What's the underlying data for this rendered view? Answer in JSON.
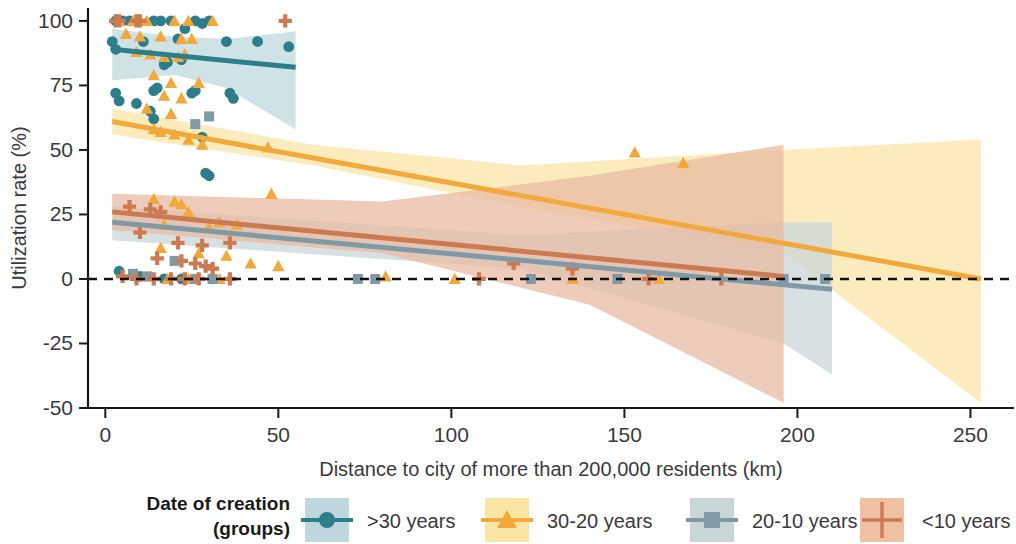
{
  "chart_data": {
    "type": "scatter",
    "title": "",
    "xlabel": "Distance to city of more than 200,000 residents (km)",
    "ylabel": "Utilization rate (%)",
    "xlim": [
      -5,
      262
    ],
    "ylim": [
      -50,
      105
    ],
    "xticks": [
      0,
      50,
      100,
      150,
      200,
      250
    ],
    "xticklabels": [
      "0",
      "50",
      "100",
      "150",
      "200",
      "250"
    ],
    "yticks": [
      -50,
      -25,
      0,
      25,
      50,
      75,
      100
    ],
    "yticklabels": [
      "-50",
      "-25",
      "0",
      "25",
      "50",
      "75",
      "100"
    ],
    "grid": false,
    "legend_position": "below",
    "reference_line": {
      "y": 0,
      "style": "dashed",
      "color": "#111111"
    },
    "series": [
      {
        "name": ">30 years",
        "marker": "circle",
        "color": "#2e7d8a",
        "band_color": "#bcd8dd",
        "fit": {
          "x0": 2,
          "y0": 89,
          "x1": 55,
          "y1": 82
        },
        "band": [
          {
            "x": 2,
            "lo": 77,
            "hi": 97
          },
          {
            "x": 20,
            "lo": 79,
            "hi": 94
          },
          {
            "x": 35,
            "lo": 74,
            "hi": 93
          },
          {
            "x": 55,
            "lo": 58,
            "hi": 96
          }
        ],
        "points": [
          {
            "x": 3,
            "y": 100
          },
          {
            "x": 5,
            "y": 100
          },
          {
            "x": 7,
            "y": 100
          },
          {
            "x": 14,
            "y": 100
          },
          {
            "x": 16,
            "y": 100
          },
          {
            "x": 19,
            "y": 100
          },
          {
            "x": 26,
            "y": 100
          },
          {
            "x": 28,
            "y": 99
          },
          {
            "x": 30,
            "y": 100
          },
          {
            "x": 2,
            "y": 92
          },
          {
            "x": 3,
            "y": 89
          },
          {
            "x": 11,
            "y": 92
          },
          {
            "x": 21,
            "y": 93
          },
          {
            "x": 23,
            "y": 97
          },
          {
            "x": 35,
            "y": 92
          },
          {
            "x": 44,
            "y": 92
          },
          {
            "x": 53,
            "y": 90
          },
          {
            "x": 17,
            "y": 83
          },
          {
            "x": 18,
            "y": 84
          },
          {
            "x": 22,
            "y": 85
          },
          {
            "x": 14,
            "y": 73
          },
          {
            "x": 15,
            "y": 74
          },
          {
            "x": 25,
            "y": 72
          },
          {
            "x": 26,
            "y": 73
          },
          {
            "x": 36,
            "y": 72
          },
          {
            "x": 37,
            "y": 70
          },
          {
            "x": 3,
            "y": 72
          },
          {
            "x": 4,
            "y": 69
          },
          {
            "x": 9,
            "y": 68
          },
          {
            "x": 13,
            "y": 65
          },
          {
            "x": 14,
            "y": 62
          },
          {
            "x": 28,
            "y": 55
          },
          {
            "x": 29,
            "y": 41
          },
          {
            "x": 30,
            "y": 40
          },
          {
            "x": 4,
            "y": 3
          },
          {
            "x": 10,
            "y": 1
          },
          {
            "x": 17,
            "y": 0
          },
          {
            "x": 22,
            "y": 0
          },
          {
            "x": 31,
            "y": 0
          }
        ]
      },
      {
        "name": "30-20 years",
        "marker": "triangle",
        "color": "#f2a93b",
        "band_color": "#fbe5a4",
        "fit": {
          "x0": 2,
          "y0": 61,
          "x1": 253,
          "y1": 0
        },
        "band": [
          {
            "x": 2,
            "lo": 56,
            "hi": 66
          },
          {
            "x": 60,
            "lo": 44,
            "hi": 52
          },
          {
            "x": 120,
            "lo": 28,
            "hi": 44
          },
          {
            "x": 196,
            "lo": 10,
            "hi": 50
          },
          {
            "x": 253,
            "lo": -48,
            "hi": 54
          }
        ],
        "points": [
          {
            "x": 4,
            "y": 100
          },
          {
            "x": 8,
            "y": 100
          },
          {
            "x": 12,
            "y": 100
          },
          {
            "x": 20,
            "y": 100
          },
          {
            "x": 24,
            "y": 100
          },
          {
            "x": 31,
            "y": 100
          },
          {
            "x": 6,
            "y": 95
          },
          {
            "x": 10,
            "y": 94
          },
          {
            "x": 16,
            "y": 94
          },
          {
            "x": 22,
            "y": 93
          },
          {
            "x": 25,
            "y": 93
          },
          {
            "x": 9,
            "y": 88
          },
          {
            "x": 13,
            "y": 87
          },
          {
            "x": 17,
            "y": 86
          },
          {
            "x": 21,
            "y": 86
          },
          {
            "x": 23,
            "y": 87
          },
          {
            "x": 14,
            "y": 79
          },
          {
            "x": 19,
            "y": 76
          },
          {
            "x": 27,
            "y": 76
          },
          {
            "x": 17,
            "y": 71
          },
          {
            "x": 22,
            "y": 70
          },
          {
            "x": 12,
            "y": 66
          },
          {
            "x": 19,
            "y": 64
          },
          {
            "x": 14,
            "y": 58
          },
          {
            "x": 16,
            "y": 57
          },
          {
            "x": 20,
            "y": 56
          },
          {
            "x": 24,
            "y": 54
          },
          {
            "x": 28,
            "y": 52
          },
          {
            "x": 47,
            "y": 51
          },
          {
            "x": 48,
            "y": 33
          },
          {
            "x": 153,
            "y": 49
          },
          {
            "x": 167,
            "y": 45
          },
          {
            "x": 14,
            "y": 31
          },
          {
            "x": 20,
            "y": 30
          },
          {
            "x": 22,
            "y": 29
          },
          {
            "x": 24,
            "y": 26
          },
          {
            "x": 17,
            "y": 21
          },
          {
            "x": 30,
            "y": 20
          },
          {
            "x": 33,
            "y": 22
          },
          {
            "x": 38,
            "y": 21
          },
          {
            "x": 16,
            "y": 12
          },
          {
            "x": 27,
            "y": 10
          },
          {
            "x": 35,
            "y": 9
          },
          {
            "x": 42,
            "y": 6
          },
          {
            "x": 50,
            "y": 5
          },
          {
            "x": 13,
            "y": 1
          },
          {
            "x": 18,
            "y": 0
          },
          {
            "x": 24,
            "y": 0
          },
          {
            "x": 33,
            "y": 0
          },
          {
            "x": 81,
            "y": 1
          },
          {
            "x": 101,
            "y": 0
          },
          {
            "x": 135,
            "y": 0
          },
          {
            "x": 160,
            "y": 0
          }
        ]
      },
      {
        "name": "20-10 years",
        "marker": "square",
        "color": "#7f9aa6",
        "band_color": "#c8d6d8",
        "fit": {
          "x0": 2,
          "y0": 22,
          "x1": 210,
          "y1": -4
        },
        "band": [
          {
            "x": 2,
            "lo": 15,
            "hi": 28
          },
          {
            "x": 120,
            "lo": 4,
            "hi": 17
          },
          {
            "x": 196,
            "lo": -25,
            "hi": 22
          },
          {
            "x": 210,
            "lo": -37,
            "hi": 22
          }
        ],
        "points": [
          {
            "x": 30,
            "y": 63
          },
          {
            "x": 26,
            "y": 60
          },
          {
            "x": 20,
            "y": 7
          },
          {
            "x": 8,
            "y": 2
          },
          {
            "x": 12,
            "y": 1
          },
          {
            "x": 26,
            "y": 0
          },
          {
            "x": 31,
            "y": 0
          },
          {
            "x": 73,
            "y": 0
          },
          {
            "x": 78,
            "y": 0
          },
          {
            "x": 123,
            "y": 0
          },
          {
            "x": 148,
            "y": 0
          },
          {
            "x": 196,
            "y": 0
          },
          {
            "x": 208,
            "y": 0
          }
        ]
      },
      {
        "name": "<10 years",
        "marker": "plus",
        "color": "#cc7a52",
        "band_color": "#e9b9a0",
        "fit": {
          "x0": 2,
          "y0": 26,
          "x1": 196,
          "y1": 1
        },
        "band": [
          {
            "x": 2,
            "lo": 19,
            "hi": 33
          },
          {
            "x": 80,
            "lo": 10,
            "hi": 30
          },
          {
            "x": 140,
            "lo": -10,
            "hi": 40
          },
          {
            "x": 196,
            "lo": -48,
            "hi": 52
          }
        ],
        "points": [
          {
            "x": 3,
            "y": 100
          },
          {
            "x": 4,
            "y": 100
          },
          {
            "x": 9,
            "y": 100
          },
          {
            "x": 10,
            "y": 100
          },
          {
            "x": 52,
            "y": 100
          },
          {
            "x": 7,
            "y": 28
          },
          {
            "x": 13,
            "y": 27
          },
          {
            "x": 16,
            "y": 26
          },
          {
            "x": 10,
            "y": 18
          },
          {
            "x": 21,
            "y": 14
          },
          {
            "x": 28,
            "y": 13
          },
          {
            "x": 36,
            "y": 14
          },
          {
            "x": 15,
            "y": 8
          },
          {
            "x": 22,
            "y": 7
          },
          {
            "x": 26,
            "y": 6
          },
          {
            "x": 29,
            "y": 5
          },
          {
            "x": 31,
            "y": 4
          },
          {
            "x": 118,
            "y": 6
          },
          {
            "x": 135,
            "y": 4
          },
          {
            "x": 5,
            "y": 1
          },
          {
            "x": 9,
            "y": 0
          },
          {
            "x": 14,
            "y": 0
          },
          {
            "x": 19,
            "y": 0
          },
          {
            "x": 23,
            "y": 0
          },
          {
            "x": 27,
            "y": 0
          },
          {
            "x": 36,
            "y": 0
          },
          {
            "x": 108,
            "y": 0
          },
          {
            "x": 157,
            "y": 0
          },
          {
            "x": 178,
            "y": 0
          }
        ]
      }
    ]
  },
  "legend": {
    "title_line1": "Date of creation",
    "title_line2": "(groups)",
    "items": [
      {
        "label": ">30 years",
        "marker": "circle-icon",
        "color": "#2e7d8a",
        "swatch": "#bcd8dd"
      },
      {
        "label": "30-20 years",
        "marker": "triangle-icon",
        "color": "#f2a93b",
        "swatch": "#fbe5a4"
      },
      {
        "label": "20-10 years",
        "marker": "square-icon",
        "color": "#7f9aa6",
        "swatch": "#c8d6d8"
      },
      {
        "label": "<10 years",
        "marker": "plus-icon",
        "color": "#cc7a52",
        "swatch": "#f0c0a4"
      }
    ]
  }
}
